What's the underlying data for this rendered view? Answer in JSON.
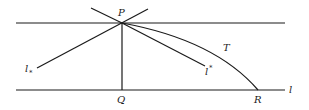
{
  "diagram": {
    "points": {
      "P": {
        "label": "P"
      },
      "Q": {
        "label": "Q"
      },
      "R": {
        "label": "R"
      }
    },
    "lines": {
      "top_line": {
        "label": ""
      },
      "bottom_line": {
        "label": "l"
      },
      "l_lower": {
        "label": "l",
        "mark": "*",
        "mark_position": "subscript"
      },
      "l_upper": {
        "label": "l",
        "mark": "*",
        "mark_position": "superscript"
      },
      "curve": {
        "label": "T"
      }
    },
    "colors": {
      "stroke": "#1a1a1a",
      "background": "#ffffff"
    }
  }
}
